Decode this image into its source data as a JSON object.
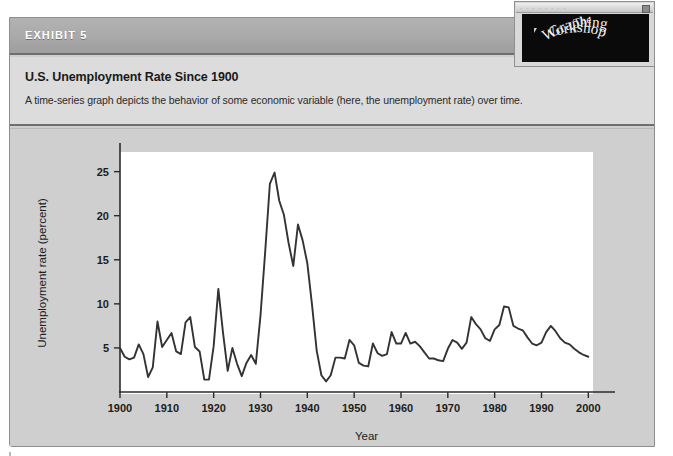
{
  "exhibit": {
    "label": "EXHIBIT 5",
    "title": "U.S. Unemployment Rate Since 1900",
    "subtitle": "A time-series graph depicts the behavior of some economic variable (here, the unemployment rate) over time."
  },
  "logo": {
    "line1": "The",
    "line2": "Graphing",
    "line3": "Workshop",
    "titlebar_dots": "· · · · · · · ·",
    "background_color": "#0a0a0a",
    "text_color": "#f2f2f2"
  },
  "colors": {
    "panel_grey": "#cfcfcf",
    "titlebar_grey": "#a9a9a9",
    "caption_grey": "#dcdcdc",
    "plot_white": "#ffffff",
    "series_stroke": "#333333",
    "axis_stroke": "#2b2b2b"
  },
  "chart_data": {
    "type": "line",
    "title": "U.S. Unemployment Rate Since 1900",
    "xlabel": "Year",
    "ylabel": "Unemployment rate (percent)",
    "xlim": [
      1900,
      2001
    ],
    "ylim": [
      0,
      27
    ],
    "grid": false,
    "legend": "none",
    "xticks": [
      1900,
      1910,
      1920,
      1930,
      1940,
      1950,
      1960,
      1970,
      1980,
      1990,
      2000
    ],
    "xtick_labels": [
      "1900",
      "1910",
      "1920",
      "1930",
      "1940",
      "1950",
      "1960",
      "1970",
      "1980",
      "1990",
      "2000"
    ],
    "yticks": [
      5,
      10,
      15,
      20,
      25
    ],
    "ytick_labels": [
      "5",
      "10",
      "15",
      "20",
      "25"
    ],
    "series": [
      {
        "name": "U.S. unemployment rate",
        "x": [
          1900,
          1901,
          1902,
          1903,
          1904,
          1905,
          1906,
          1907,
          1908,
          1909,
          1910,
          1911,
          1912,
          1913,
          1914,
          1915,
          1916,
          1917,
          1918,
          1919,
          1920,
          1921,
          1922,
          1923,
          1924,
          1925,
          1926,
          1927,
          1928,
          1929,
          1930,
          1931,
          1932,
          1933,
          1934,
          1935,
          1936,
          1937,
          1938,
          1939,
          1940,
          1941,
          1942,
          1943,
          1944,
          1945,
          1946,
          1947,
          1948,
          1949,
          1950,
          1951,
          1952,
          1953,
          1954,
          1955,
          1956,
          1957,
          1958,
          1959,
          1960,
          1961,
          1962,
          1963,
          1964,
          1965,
          1966,
          1967,
          1968,
          1969,
          1970,
          1971,
          1972,
          1973,
          1974,
          1975,
          1976,
          1977,
          1978,
          1979,
          1980,
          1981,
          1982,
          1983,
          1984,
          1985,
          1986,
          1987,
          1988,
          1989,
          1990,
          1991,
          1992,
          1993,
          1994,
          1995,
          1996,
          1997,
          1998,
          1999,
          2000
        ],
        "y": [
          5.0,
          4.0,
          3.7,
          3.9,
          5.4,
          4.3,
          1.7,
          2.8,
          8.0,
          5.1,
          5.9,
          6.7,
          4.6,
          4.3,
          7.9,
          8.5,
          5.1,
          4.6,
          1.4,
          1.4,
          5.2,
          11.7,
          6.7,
          2.4,
          5.0,
          3.2,
          1.8,
          3.3,
          4.2,
          3.2,
          8.7,
          15.9,
          23.6,
          24.9,
          21.7,
          20.1,
          16.9,
          14.3,
          19.0,
          17.2,
          14.6,
          9.9,
          4.7,
          1.9,
          1.2,
          1.9,
          3.9,
          3.9,
          3.8,
          5.9,
          5.3,
          3.3,
          3.0,
          2.9,
          5.5,
          4.4,
          4.1,
          4.3,
          6.8,
          5.5,
          5.5,
          6.7,
          5.5,
          5.7,
          5.2,
          4.5,
          3.8,
          3.8,
          3.6,
          3.5,
          4.9,
          5.9,
          5.6,
          4.9,
          5.6,
          8.5,
          7.7,
          7.1,
          6.1,
          5.8,
          7.1,
          7.6,
          9.7,
          9.6,
          7.5,
          7.2,
          7.0,
          6.2,
          5.5,
          5.3,
          5.6,
          6.8,
          7.5,
          6.9,
          6.1,
          5.6,
          5.4,
          4.9,
          4.5,
          4.2,
          4.0
        ]
      }
    ]
  }
}
